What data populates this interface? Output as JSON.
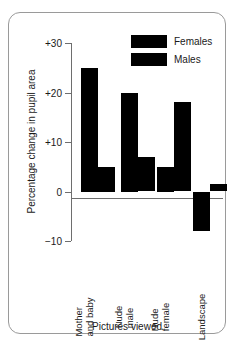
{
  "chart_data": {
    "type": "bar",
    "title": "",
    "xlabel": "Pictures viewed",
    "ylabel": "Percentage change in pupil area",
    "categories": [
      "Mother and baby",
      "Nude male",
      "Nude female",
      "Landscape"
    ],
    "category_lines": [
      [
        "Mother",
        "and baby"
      ],
      [
        "Nude",
        "male"
      ],
      [
        "Nude",
        "female"
      ],
      [
        "Landscape"
      ]
    ],
    "series": [
      {
        "name": "Females",
        "color": "#000000",
        "values": [
          25,
          20,
          5,
          -8
        ]
      },
      {
        "name": "Males",
        "color": "#000000",
        "values": [
          5,
          7,
          18,
          1.5
        ]
      }
    ],
    "ylim": [
      -10,
      30
    ],
    "yticks": [
      30,
      20,
      10,
      0,
      -10
    ],
    "ytick_labels": [
      "+30",
      "+20",
      "+10",
      "0",
      "−10"
    ],
    "grid": false,
    "legend_position": "top-right",
    "legend": [
      "Females",
      "Males"
    ]
  },
  "legend": {
    "items": [
      {
        "label": "Females"
      },
      {
        "label": "Males"
      }
    ]
  },
  "axes": {
    "y_title": "Percentage change in pupil area",
    "x_title": "Pictures viewed"
  }
}
